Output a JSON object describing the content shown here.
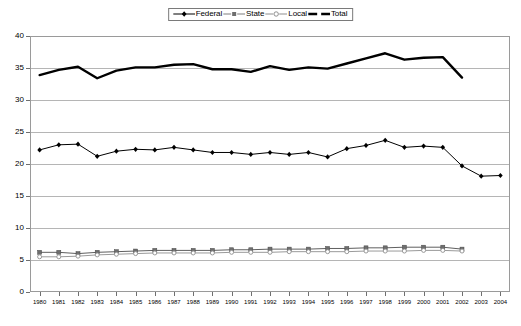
{
  "legend": {
    "position": "top-center",
    "boxed": true,
    "entries": [
      {
        "label": "Federal",
        "marker": "diamond",
        "color": "#000000"
      },
      {
        "label": "State",
        "marker": "square",
        "color": "#7f7f7f"
      },
      {
        "label": "Local",
        "marker": "circle",
        "color": "#9a9a9a"
      },
      {
        "label": "Total",
        "marker": "none",
        "color": "#000000"
      }
    ]
  },
  "axes": {
    "y": {
      "min": 0,
      "max": 40,
      "step": 5,
      "ticks": [
        "0",
        "5",
        "10",
        "15",
        "20",
        "25",
        "30",
        "35",
        "40"
      ],
      "label": ""
    },
    "x": {
      "label": "",
      "ticks": [
        "1980",
        "1981",
        "1982",
        "1983",
        "1984",
        "1985",
        "1986",
        "1987",
        "1988",
        "1989",
        "1990",
        "1991",
        "1992",
        "1993",
        "1994",
        "1995",
        "1996",
        "1997",
        "1998",
        "1999",
        "2000",
        "2001",
        "2002",
        "2003",
        "2004"
      ]
    }
  },
  "chart_data": {
    "type": "line",
    "title": "",
    "subtitle": "",
    "xlabel": "",
    "ylabel": "",
    "xlim": [
      1980,
      2004
    ],
    "ylim": [
      0,
      40
    ],
    "grid": true,
    "legend_position": "top-center",
    "x": [
      1980,
      1981,
      1982,
      1983,
      1984,
      1985,
      1986,
      1987,
      1988,
      1989,
      1990,
      1991,
      1992,
      1993,
      1994,
      1995,
      1996,
      1997,
      1998,
      1999,
      2000,
      2001,
      2002,
      2003,
      2004
    ],
    "series": [
      {
        "name": "Federal",
        "marker": "diamond",
        "color": "#000000",
        "values": [
          22.2,
          23.0,
          23.1,
          21.2,
          22.0,
          22.3,
          22.2,
          22.6,
          22.2,
          21.8,
          21.8,
          21.5,
          21.8,
          21.5,
          21.8,
          21.1,
          22.4,
          22.9,
          23.7,
          22.6,
          22.8,
          22.6,
          19.7,
          18.1,
          18.2
        ]
      },
      {
        "name": "State",
        "marker": "square",
        "color": "#7f7f7f",
        "values": [
          6.2,
          6.2,
          6.0,
          6.2,
          6.3,
          6.4,
          6.5,
          6.5,
          6.5,
          6.5,
          6.6,
          6.6,
          6.7,
          6.7,
          6.7,
          6.8,
          6.8,
          6.9,
          6.9,
          7.0,
          7.0,
          7.0,
          6.7,
          null,
          null
        ]
      },
      {
        "name": "Local",
        "marker": "circle",
        "color": "#9a9a9a",
        "values": [
          5.5,
          5.5,
          5.6,
          5.8,
          5.9,
          6.0,
          6.1,
          6.1,
          6.1,
          6.1,
          6.2,
          6.2,
          6.2,
          6.3,
          6.3,
          6.3,
          6.3,
          6.4,
          6.4,
          6.4,
          6.5,
          6.5,
          6.4,
          null,
          null
        ]
      },
      {
        "name": "Total",
        "marker": "none",
        "color": "#000000",
        "values": [
          33.9,
          34.7,
          35.2,
          33.4,
          34.6,
          35.1,
          35.1,
          35.5,
          35.6,
          34.8,
          34.8,
          34.4,
          35.3,
          34.7,
          35.1,
          34.9,
          35.7,
          36.5,
          37.3,
          36.3,
          36.6,
          36.7,
          33.5,
          null,
          null
        ]
      }
    ]
  }
}
